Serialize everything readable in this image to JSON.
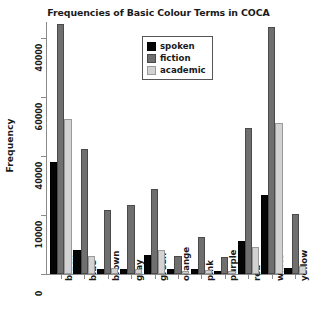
{
  "chart_data": {
    "type": "bar",
    "title": "Frequencies of Basic Colour Terms in COCA",
    "xlabel": "",
    "ylabel": "Frequency",
    "grid": false,
    "legend_position": "top-center",
    "categories": [
      "black",
      "blue",
      "brown",
      "gray",
      "green",
      "orange",
      "pink",
      "purple",
      "red",
      "white",
      "yellow"
    ],
    "y_tick_labels": [
      "0",
      "10000",
      "40000",
      "60000",
      "40000"
    ],
    "y_tick_values": [
      0,
      10000,
      20000,
      30000,
      40000
    ],
    "ylim": [
      0,
      43000
    ],
    "series": [
      {
        "name": "spoken",
        "color": "#050505",
        "values": [
          19000,
          4100,
          900,
          850,
          3300,
          800,
          900,
          450,
          5600,
          13300,
          950
        ]
      },
      {
        "name": "fiction",
        "color": "#6f6f6f",
        "values": [
          42400,
          21100,
          10800,
          11700,
          14400,
          3000,
          6200,
          2900,
          24700,
          41900,
          10200
        ]
      },
      {
        "name": "academic",
        "color": "#d2d2d2",
        "values": [
          26300,
          3000,
          950,
          900,
          4000,
          550,
          600,
          500,
          4600,
          25600,
          1400
        ]
      }
    ]
  },
  "legend": {
    "entries": [
      {
        "label": "spoken"
      },
      {
        "label": "fiction"
      },
      {
        "label": "academic"
      }
    ]
  }
}
